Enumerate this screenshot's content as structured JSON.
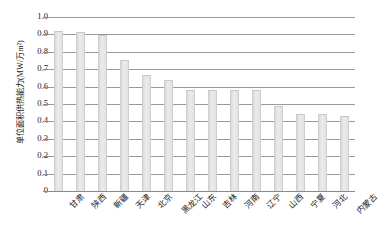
{
  "chart_data": {
    "type": "bar",
    "title": "",
    "xlabel": "",
    "ylabel": "单位面积供热能力(MW/万m²)",
    "ylim": [
      0,
      1.0
    ],
    "ytick_labels": [
      "1.0",
      "0.9",
      "0.8",
      "0.7",
      "0.6",
      "0.5",
      "0.4",
      "0.3",
      "0.2",
      "0.1",
      "0"
    ],
    "ytick_values": [
      1.0,
      0.9,
      0.8,
      0.7,
      0.6,
      0.5,
      0.4,
      0.3,
      0.2,
      0.1,
      0
    ],
    "grid": true,
    "legend": "none",
    "categories": [
      "甘肃",
      "陕西",
      "新疆",
      "天津",
      "北京",
      "黑龙江",
      "山东",
      "吉林",
      "河南",
      "辽宁",
      "山西",
      "宁夏",
      "河北",
      "内蒙古"
    ],
    "values": [
      0.92,
      0.915,
      0.895,
      0.755,
      0.665,
      0.64,
      0.58,
      0.58,
      0.58,
      0.58,
      0.49,
      0.44,
      0.44,
      0.43
    ],
    "bar_color": "#e2e2e2",
    "gridline_color": "#9a9a9a",
    "axis_color": "#8a8a8a",
    "text_color": "#1a1a1a"
  }
}
